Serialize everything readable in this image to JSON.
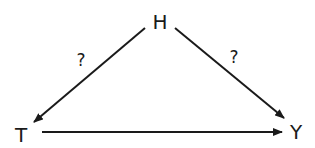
{
  "diagram": {
    "nodes": [
      {
        "id": "H",
        "label": "H"
      },
      {
        "id": "T",
        "label": "T"
      },
      {
        "id": "Y",
        "label": "Y"
      }
    ],
    "edges": [
      {
        "from": "H",
        "to": "T",
        "label": "?"
      },
      {
        "from": "H",
        "to": "Y",
        "label": "?"
      },
      {
        "from": "T",
        "to": "Y",
        "label": ""
      }
    ],
    "colors": {
      "stroke": "#1a1a1a",
      "background": "#ffffff"
    }
  }
}
